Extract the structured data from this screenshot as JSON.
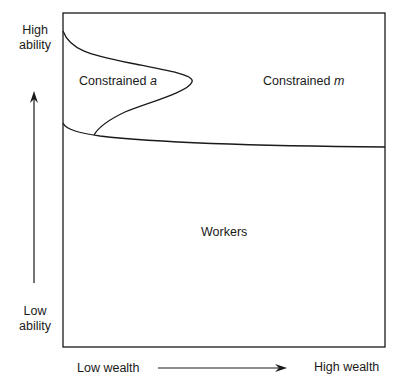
{
  "diagram": {
    "y_axis": {
      "high_label_line1": "High",
      "high_label_line2": "ability",
      "low_label_line1": "Low",
      "low_label_line2": "ability"
    },
    "x_axis": {
      "low_label": "Low wealth",
      "high_label": "High wealth"
    },
    "regions": {
      "constrained_a_text": "Constrained ",
      "constrained_a_var": "a",
      "constrained_m_text": "Constrained ",
      "constrained_m_var": "m",
      "workers": "Workers"
    },
    "colors": {
      "line": "#1a1a1a",
      "background": "#ffffff"
    }
  }
}
